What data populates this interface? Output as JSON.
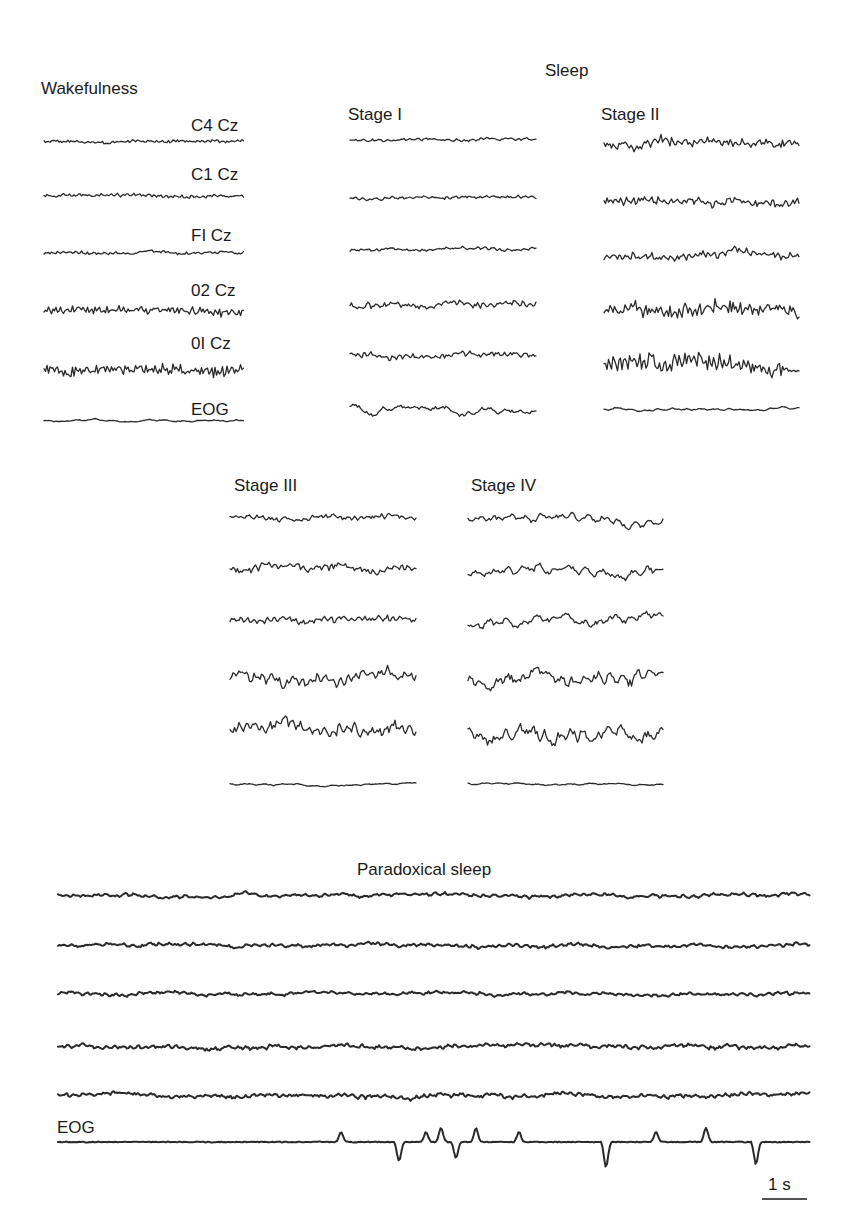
{
  "figure": {
    "section_wake": "Wakefulness",
    "section_sleep": "Sleep",
    "section_paradoxical": "Paradoxical sleep",
    "stages": {
      "stage1": "Stage I",
      "stage2": "Stage II",
      "stage3": "Stage III",
      "stage4": "Stage IV"
    },
    "channels": [
      "C4 Cz",
      "C1 Cz",
      "FI Cz",
      "02 Cz",
      "0I Cz",
      "EOG"
    ],
    "eog_label": "EOG",
    "scale_bar": "1 s",
    "ink_color": "#2a2a2a"
  },
  "chart_data": {
    "type": "line",
    "x_unit": "time (s), scale bar = 1 s",
    "panels": [
      {
        "name": "Wakefulness",
        "x": 44,
        "width": 200,
        "ys": [
          141,
          196,
          253,
          311,
          369,
          421
        ],
        "channels": [
          "C4 Cz",
          "C1 Cz",
          "FI Cz",
          "02 Cz",
          "0I Cz",
          "EOG"
        ],
        "amplitudes": [
          2.5,
          3,
          2.5,
          6,
          8,
          2
        ],
        "freq": [
          1.4,
          1.3,
          1.2,
          1.8,
          2.0,
          0.4
        ],
        "seeds": [
          1,
          2,
          3,
          4,
          5,
          6
        ],
        "character": "low-amplitude fast activity; alpha on occipital channels"
      },
      {
        "name": "Stage I",
        "x": 350,
        "width": 186,
        "ys": [
          140,
          198,
          250,
          305,
          355,
          410
        ],
        "amplitudes": [
          3,
          3,
          3,
          6,
          5,
          8
        ],
        "freq": [
          0.9,
          0.9,
          0.9,
          0.9,
          1.0,
          0.15
        ],
        "seeds": [
          11,
          12,
          13,
          14,
          15,
          16
        ],
        "character": "low-voltage mixed frequency; slow rolling eye movements"
      },
      {
        "name": "Stage II",
        "x": 604,
        "width": 196,
        "ys": [
          145,
          203,
          255,
          310,
          366,
          410
        ],
        "amplitudes": [
          8,
          8,
          8,
          12,
          13,
          2.5
        ],
        "freq": [
          1.2,
          1.1,
          1.1,
          1.4,
          1.4,
          0.5
        ],
        "seeds": [
          21,
          22,
          23,
          24,
          25,
          26
        ],
        "character": "K-complexes and sleep spindles"
      },
      {
        "name": "Stage III",
        "x": 230,
        "width": 186,
        "ys": [
          517,
          570,
          620,
          680,
          730,
          784
        ],
        "amplitudes": [
          5,
          7,
          6,
          11,
          11,
          2
        ],
        "freq": [
          1.0,
          1.0,
          1.0,
          0.9,
          0.9,
          0.4
        ],
        "seeds": [
          31,
          32,
          33,
          34,
          35,
          36
        ],
        "character": "moderate delta activity with spindles"
      },
      {
        "name": "Stage IV",
        "x": 468,
        "width": 196,
        "ys": [
          517,
          570,
          622,
          680,
          733,
          784
        ],
        "amplitudes": [
          9,
          10,
          10,
          14,
          14,
          1.8
        ],
        "freq": [
          0.45,
          0.45,
          0.45,
          0.55,
          0.55,
          0.4
        ],
        "seeds": [
          41,
          42,
          43,
          44,
          45,
          46
        ],
        "character": "high-amplitude slow delta waves"
      },
      {
        "name": "Paradoxical sleep",
        "x": 58,
        "width": 752,
        "ys": [
          895,
          945,
          994,
          1046,
          1095,
          1142
        ],
        "amplitudes": [
          3.5,
          3.5,
          3.5,
          4,
          4,
          0
        ],
        "freq": [
          0.7,
          0.8,
          0.8,
          0.9,
          0.9,
          0
        ],
        "seeds": [
          51,
          52,
          53,
          54,
          55,
          56
        ],
        "character": "low-voltage desynchronized EEG; rapid eye movements on EOG",
        "eog_events_x": [
          340,
          398,
          425,
          440,
          455,
          475,
          518,
          605,
          655,
          705,
          755
        ]
      }
    ]
  }
}
